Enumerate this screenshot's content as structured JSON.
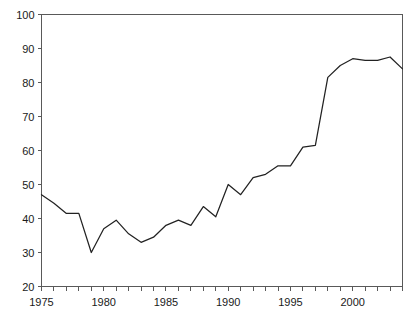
{
  "chart_data": {
    "type": "line",
    "title": "",
    "subtitle": "",
    "xlabel": "",
    "ylabel": "",
    "xlim": [
      1975,
      2004
    ],
    "ylim": [
      20,
      100
    ],
    "grid": false,
    "legend": null,
    "y_ticks": [
      20,
      30,
      40,
      50,
      60,
      70,
      80,
      90,
      100
    ],
    "y_tick_labels": [
      "20",
      "30",
      "40",
      "50",
      "60",
      "70",
      "80",
      "90",
      "100"
    ],
    "x_ticks": [
      1975,
      1976,
      1977,
      1978,
      1979,
      1980,
      1981,
      1982,
      1983,
      1984,
      1985,
      1986,
      1987,
      1988,
      1989,
      1990,
      1991,
      1992,
      1993,
      1994,
      1995,
      1996,
      1997,
      1998,
      1999,
      2000,
      2001,
      2002,
      2003,
      2004
    ],
    "x_tick_labels_shown": [
      "1975",
      "1980",
      "1985",
      "1990",
      "1995",
      "2000"
    ],
    "x_labeled_ticks": [
      1975,
      1980,
      1985,
      1990,
      1995,
      2000
    ],
    "line_color": "#222222",
    "axis_color": "#595959",
    "series": [
      {
        "name": "series-1",
        "x": [
          1975,
          1976,
          1977,
          1978,
          1979,
          1980,
          1981,
          1982,
          1983,
          1984,
          1985,
          1986,
          1987,
          1988,
          1989,
          1990,
          1991,
          1992,
          1993,
          1994,
          1995,
          1996,
          1997,
          1998,
          1999,
          2000,
          2001,
          2002,
          2003,
          2004
        ],
        "values": [
          47,
          44.5,
          41.5,
          41.5,
          30,
          37,
          39.5,
          35.5,
          33,
          34.5,
          38,
          39.5,
          38,
          43.5,
          40.5,
          50,
          47,
          52,
          53,
          55.5,
          55.5,
          61,
          61.5,
          81.5,
          85,
          87,
          86.5,
          86.5,
          87.5,
          84
        ]
      }
    ]
  }
}
